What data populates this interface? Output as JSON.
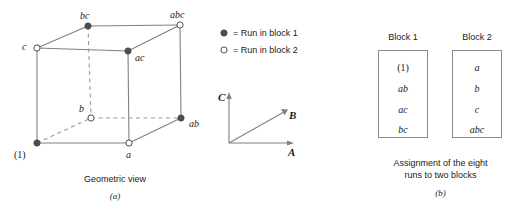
{
  "figure": {
    "panel_a": {
      "caption": "Geometric view",
      "panel_label": "(a)",
      "vertices": [
        {
          "id": "one",
          "label": "(1)",
          "block": 1,
          "marker": "filled",
          "x": 37,
          "y": 143
        },
        {
          "id": "a",
          "label": "a",
          "block": 2,
          "marker": "open",
          "x": 129,
          "y": 143
        },
        {
          "id": "b",
          "label": "b",
          "block": 2,
          "marker": "open",
          "x": 91,
          "y": 118
        },
        {
          "id": "ab",
          "label": "ab",
          "block": 1,
          "marker": "filled",
          "x": 181,
          "y": 118
        },
        {
          "id": "c",
          "label": "c",
          "block": 2,
          "marker": "open",
          "x": 37,
          "y": 48
        },
        {
          "id": "ac",
          "label": "ac",
          "block": 1,
          "marker": "filled",
          "x": 128,
          "y": 51
        },
        {
          "id": "bc",
          "label": "bc",
          "block": 1,
          "marker": "filled",
          "x": 88,
          "y": 26
        },
        {
          "id": "abc",
          "label": "abc",
          "block": 2,
          "marker": "open",
          "x": 180,
          "y": 25
        }
      ]
    },
    "legend": {
      "items": [
        {
          "marker": "filled",
          "text": "= Run in block 1"
        },
        {
          "marker": "open",
          "text": "= Run in block 2"
        }
      ]
    },
    "axes": {
      "a_label": "A",
      "b_label": "B",
      "c_label": "C"
    },
    "panel_b": {
      "caption_line1": "Assignment of the eight",
      "caption_line2": "runs to two blocks",
      "panel_label": "(b)",
      "blocks": [
        {
          "title": "Block 1",
          "runs": [
            "(1)",
            "ab",
            "ac",
            "bc"
          ]
        },
        {
          "title": "Block 2",
          "runs": [
            "a",
            "b",
            "c",
            "abc"
          ]
        }
      ]
    },
    "colors": {
      "line": "#808080",
      "dashed": "#999999",
      "marker_fill": "#4d4d4d",
      "marker_stroke": "#4d4d4d",
      "box_border": "#8c8c8c",
      "text": "#1a1a1a",
      "background": "#ffffff"
    }
  }
}
